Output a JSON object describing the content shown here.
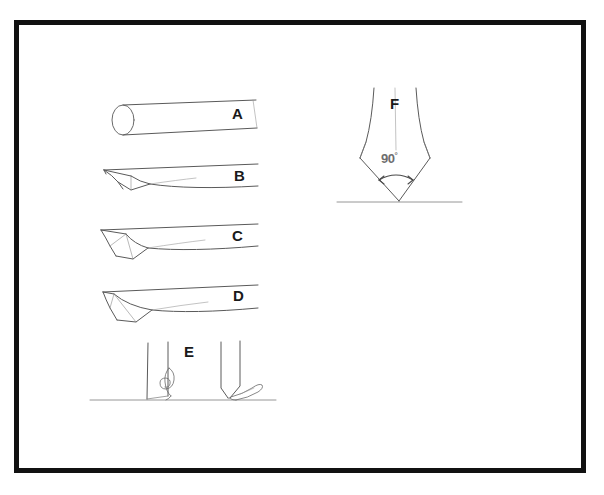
{
  "figure": {
    "background_color": "#ffffff",
    "frame_color": "#111111",
    "line_color": "#5a5a5a",
    "label_color": "#1a1a1a"
  },
  "labels": {
    "a": "A",
    "b": "B",
    "c": "C",
    "d": "D",
    "e": "E",
    "f": "F"
  },
  "annotations": {
    "apex_angle_value": "90",
    "apex_angle_unit": "°"
  },
  "panels": [
    {
      "id": "a",
      "label": "A",
      "description": "cylindrical rod stock shown in perspective with elliptical end face"
    },
    {
      "id": "b",
      "label": "B",
      "description": "rod with one end flattened into a broad tapered wedge"
    },
    {
      "id": "c",
      "label": "C",
      "description": "rod with end drawn into a narrower tapered wedge"
    },
    {
      "id": "d",
      "label": "D",
      "description": "rod with end formed into the narrowest chisel taper"
    },
    {
      "id": "e",
      "label": "E",
      "description": "two vertical shafts resting on a ground line with curled shavings at their tips"
    },
    {
      "id": "f",
      "label": "F",
      "description": "end view of finished point on a ground line with apex angle arrow"
    }
  ]
}
